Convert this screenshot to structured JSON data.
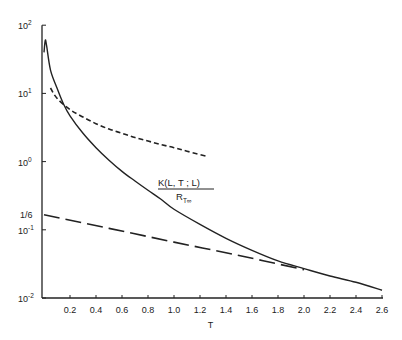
{
  "chart_data": {
    "type": "line",
    "title": "",
    "xlabel": "T",
    "ylabel": "",
    "yscale": "log",
    "xlim": [
      0,
      2.6
    ],
    "ylim": [
      0.01,
      100
    ],
    "grid": false,
    "x_ticks": [
      "0.2",
      "0.4",
      "0.6",
      "0.8",
      "1.0",
      "1.2",
      "1.4",
      "1.6",
      "1.8",
      "2.0",
      "2.2",
      "2.4",
      "2.6"
    ],
    "x_tick_values": [
      0.2,
      0.4,
      0.6,
      0.8,
      1.0,
      1.2,
      1.4,
      1.6,
      1.8,
      2.0,
      2.2,
      2.4,
      2.6
    ],
    "y_ticks": [
      {
        "label_base": "10",
        "label_exp": "2",
        "value": 100
      },
      {
        "label_base": "10",
        "label_exp": "1",
        "value": 10
      },
      {
        "label_base": "10",
        "label_exp": "0",
        "value": 1
      },
      {
        "label_base": "10",
        "label_exp": "-1",
        "value": 0.1
      },
      {
        "label_base": "10",
        "label_exp": "-2",
        "value": 0.01
      }
    ],
    "extra_y_label": {
      "text": "1/6",
      "value": 0.1667
    },
    "annotation": {
      "numerator": "K(L, T ; L)",
      "denominator": "R",
      "denominator_sub": "T∞",
      "x": 1.0,
      "y": 0.62
    },
    "series": [
      {
        "name": "K(L,T;L)/R_T∞",
        "style": "solid",
        "x": [
          0.0,
          0.01,
          0.02,
          0.05,
          0.1,
          0.15,
          0.2,
          0.3,
          0.4,
          0.5,
          0.6,
          0.7,
          0.8,
          0.9,
          1.0,
          1.2,
          1.4,
          1.6,
          1.8,
          2.0,
          2.2,
          2.4,
          2.6
        ],
        "values": [
          40,
          60,
          50,
          22,
          12,
          7,
          4.7,
          2.6,
          1.6,
          1.05,
          0.72,
          0.52,
          0.38,
          0.28,
          0.2,
          0.12,
          0.075,
          0.05,
          0.035,
          0.027,
          0.021,
          0.017,
          0.013
        ]
      },
      {
        "name": "short-dashed asymptote",
        "style": "short-dash",
        "x": [
          0.05,
          0.1,
          0.2,
          0.3,
          0.4,
          0.5,
          0.6,
          0.7,
          0.8,
          0.9,
          1.0,
          1.1,
          1.25
        ],
        "values": [
          12,
          8.5,
          5.8,
          4.5,
          3.6,
          3.0,
          2.6,
          2.25,
          2.0,
          1.78,
          1.6,
          1.42,
          1.2
        ]
      },
      {
        "name": "long-dashed asymptote",
        "style": "long-dash",
        "x": [
          0.0,
          0.5,
          1.0,
          1.5,
          2.0
        ],
        "values": [
          0.1667,
          0.105,
          0.066,
          0.042,
          0.026
        ]
      }
    ]
  }
}
